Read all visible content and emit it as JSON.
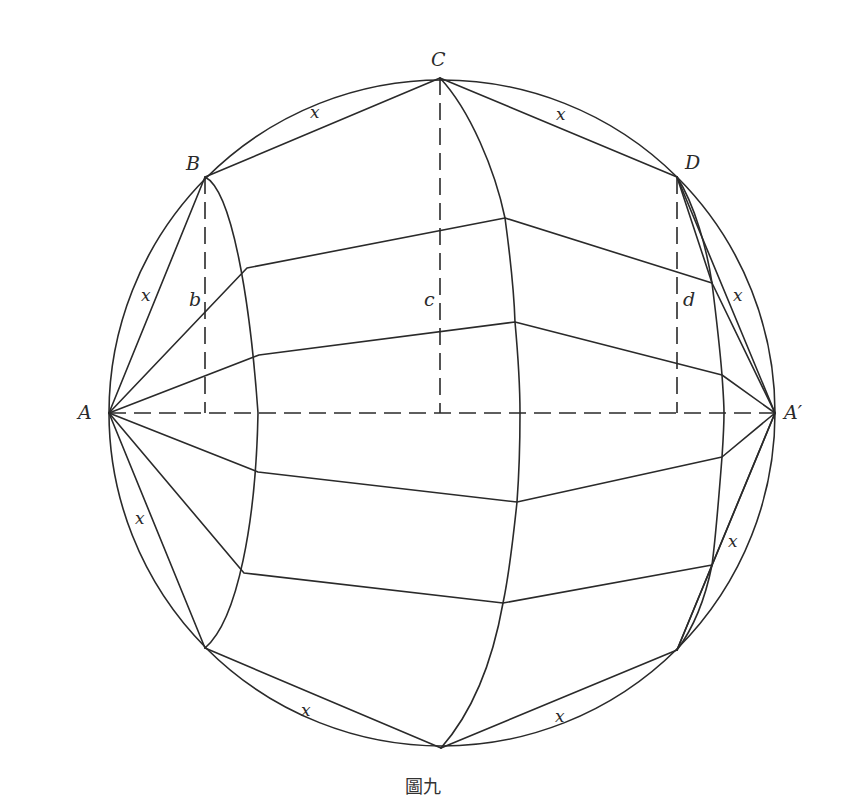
{
  "figure": {
    "caption": "圖九",
    "stroke_color": "#2a2a2a",
    "background": "#ffffff",
    "points": {
      "A": {
        "label": "A",
        "x": 109,
        "y": 413
      },
      "A_prime": {
        "label": "A′",
        "x": 775,
        "y": 413
      },
      "B": {
        "label": "B",
        "x": 205,
        "y": 177
      },
      "C": {
        "label": "C",
        "x": 440,
        "y": 78
      },
      "D": {
        "label": "D",
        "x": 677,
        "y": 177
      }
    },
    "heights": {
      "b": "b",
      "c": "c",
      "d": "d"
    },
    "chord_label": "x",
    "chord_labels": [
      "x",
      "x",
      "x",
      "x",
      "x",
      "x",
      "x",
      "x"
    ]
  }
}
